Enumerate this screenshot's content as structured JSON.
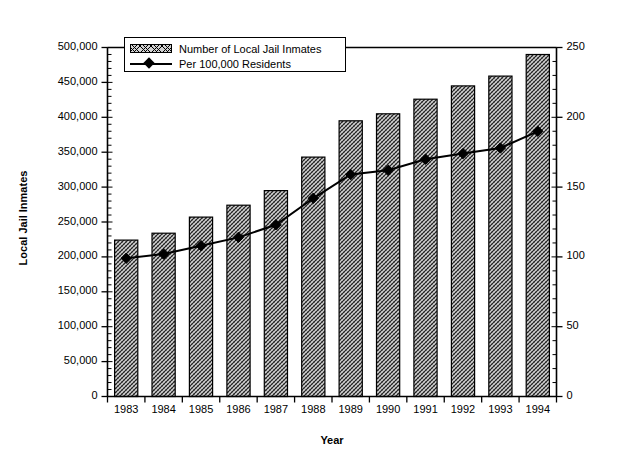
{
  "chart_data": {
    "type": "bar",
    "title": "",
    "xlabel": "Year",
    "ylabel": "Local Jail Inmates",
    "ylabel_secondary": "Jail Inmates per 100,000 Residents",
    "categories": [
      "1983",
      "1984",
      "1985",
      "1986",
      "1987",
      "1988",
      "1989",
      "1990",
      "1991",
      "1992",
      "1993",
      "1994"
    ],
    "ylim": [
      0,
      500000
    ],
    "ylim_secondary": [
      0,
      250
    ],
    "yticks": [
      "0",
      "50,000",
      "100,000",
      "150,000",
      "200,000",
      "250,000",
      "300,000",
      "350,000",
      "400,000",
      "450,000",
      "500,000"
    ],
    "ytick_values": [
      0,
      50000,
      100000,
      150000,
      200000,
      250000,
      300000,
      350000,
      400000,
      450000,
      500000
    ],
    "yticks_secondary": [
      "0",
      "50",
      "100",
      "150",
      "200",
      "250"
    ],
    "ytick_values_secondary": [
      0,
      50,
      100,
      150,
      200,
      250
    ],
    "grid": false,
    "minor_ticks": true,
    "legend_position": "top-left-inside",
    "series": [
      {
        "name": "Number of Local Jail Inmates",
        "kind": "bar",
        "axis": "left",
        "values": [
          224000,
          234000,
          257000,
          274000,
          295000,
          343000,
          395000,
          405000,
          426000,
          445000,
          459000,
          490000
        ]
      },
      {
        "name": "Per 100,000 Residents",
        "kind": "line",
        "axis": "right",
        "marker": "diamond",
        "values": [
          99,
          102,
          108,
          114,
          123,
          142,
          159,
          162,
          170,
          174,
          178,
          190
        ]
      }
    ]
  },
  "legend": {
    "items": [
      {
        "label": "Number of Local Jail Inmates",
        "swatch": "hatched-bar-swatch"
      },
      {
        "label": "Per 100,000 Residents",
        "swatch": "line-diamond-swatch"
      }
    ]
  },
  "colors": {
    "axis": "#000000",
    "bar_fill": "#d2d2d2",
    "bar_edge": "#000000",
    "line": "#000000",
    "marker": "#000000",
    "background": "#ffffff"
  }
}
